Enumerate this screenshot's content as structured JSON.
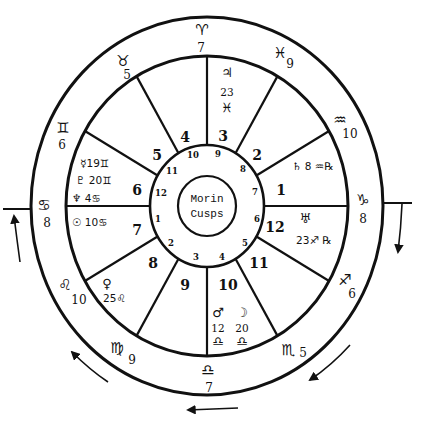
{
  "chart": {
    "center_label": {
      "line1": "Morin",
      "line2": "Cusps"
    },
    "zodiac_ring": [
      {
        "name": "aries",
        "sign": "♈",
        "degree": "7"
      },
      {
        "name": "taurus",
        "sign": "♉",
        "degree": "5"
      },
      {
        "name": "gemini",
        "sign": "♊",
        "degree": "6"
      },
      {
        "name": "cancer",
        "sign": "♋",
        "degree": "8"
      },
      {
        "name": "leo",
        "sign": "♌",
        "degree": "10"
      },
      {
        "name": "virgo",
        "sign": "♍",
        "degree": "9"
      },
      {
        "name": "libra",
        "sign": "♎",
        "degree": "7"
      },
      {
        "name": "scorpio",
        "sign": "♏",
        "degree": "5"
      },
      {
        "name": "sagittarius",
        "sign": "♐",
        "degree": "6"
      },
      {
        "name": "capricorn",
        "sign": "♑",
        "degree": "8"
      },
      {
        "name": "aquarius",
        "sign": "♒",
        "degree": "10"
      },
      {
        "name": "pisces",
        "sign": "♓",
        "degree": "9"
      }
    ],
    "houses": [
      "1",
      "2",
      "3",
      "4",
      "5",
      "6",
      "7",
      "8",
      "9",
      "10",
      "11",
      "12"
    ],
    "inner_cusps": [
      "1",
      "2",
      "3",
      "4",
      "5",
      "6",
      "7",
      "8",
      "9",
      "10",
      "11",
      "12"
    ],
    "planets": {
      "jupiter": {
        "glyph": "♃",
        "degree": "23",
        "sign": "♓"
      },
      "saturn": {
        "glyph": "♄",
        "degree": "8",
        "sign": "♒",
        "retrograde": "℞"
      },
      "uranus": {
        "glyph": "♅",
        "degree": "23",
        "sign": "♐",
        "retrograde": "℞"
      },
      "mars": {
        "glyph": "♂",
        "degree": "12",
        "sign": "♎"
      },
      "moon": {
        "glyph": "☽",
        "degree": "20",
        "sign": "♎"
      },
      "venus": {
        "glyph": "♀",
        "degree": "25",
        "sign": "♌"
      },
      "mercury": {
        "glyph": "☿",
        "degree": "19",
        "sign": "♊"
      },
      "pluto": {
        "glyph": "♇",
        "degree": "20",
        "sign": "♊"
      },
      "neptune": {
        "glyph": "♆",
        "degree": "4",
        "sign": "♋"
      },
      "sun": {
        "glyph": "☉",
        "degree": "10",
        "sign": "♋"
      }
    },
    "colors": {
      "ink": "#111111",
      "paper": "#ffffff"
    }
  }
}
